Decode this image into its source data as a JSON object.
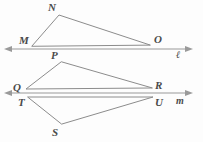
{
  "figure": {
    "background_color": "#fdfdfd",
    "stroke_color": "#8c8c8c",
    "label_color": "#4a4a4a"
  },
  "lines": [
    {
      "id": "line-l",
      "label": "ℓ",
      "label_x": 176,
      "label_y": 58,
      "y": 49,
      "x_start": 5,
      "x_end": 192,
      "arrow_left": true,
      "arrow_right": true
    },
    {
      "id": "line-m",
      "label": "m",
      "label_x": 176,
      "label_y": 104,
      "y": 93,
      "x_start": 5,
      "x_end": 192,
      "arrow_left": true,
      "arrow_right": true
    }
  ],
  "triangles": [
    {
      "id": "triangle-MNO",
      "name": "MNO",
      "vertices": [
        {
          "label": "M",
          "x": 32,
          "y": 46,
          "label_x": 19,
          "label_y": 44
        },
        {
          "label": "N",
          "x": 59,
          "y": 15,
          "label_x": 48,
          "label_y": 11
        },
        {
          "label": "O",
          "x": 150,
          "y": 45,
          "label_x": 154,
          "label_y": 43
        }
      ]
    },
    {
      "id": "triangle-PQR",
      "name": "PQR",
      "vertices": [
        {
          "label": "P",
          "x": 61,
          "y": 62,
          "label_x": 51,
          "label_y": 59
        },
        {
          "label": "Q",
          "x": 26,
          "y": 89,
          "label_x": 13,
          "label_y": 89
        },
        {
          "label": "R",
          "x": 152,
          "y": 88,
          "label_x": 155,
          "label_y": 88
        }
      ]
    },
    {
      "id": "triangle-TUS",
      "name": "TUS",
      "vertices": [
        {
          "label": "T",
          "x": 28,
          "y": 97,
          "label_x": 18,
          "label_y": 105
        },
        {
          "label": "U",
          "x": 153,
          "y": 97,
          "label_x": 155,
          "label_y": 104
        },
        {
          "label": "S",
          "x": 62,
          "y": 124,
          "label_x": 52,
          "label_y": 135
        }
      ]
    }
  ]
}
